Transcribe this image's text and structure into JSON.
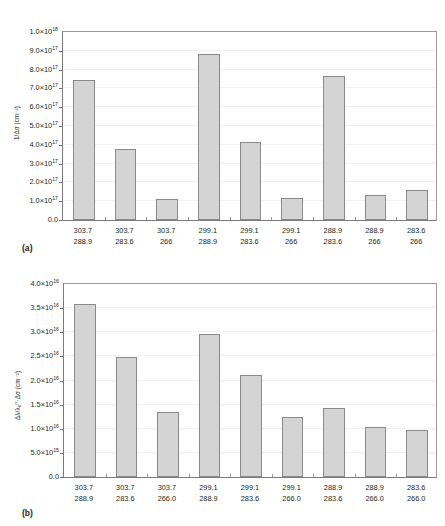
{
  "figure": {
    "panels": [
      {
        "tag": "(a)",
        "ylabel": "1/Δσ (cm⁻²)",
        "ytick_labels": [
          {
            "mantissa": "1.0×10",
            "exp": "18"
          },
          {
            "mantissa": "9.0×10",
            "exp": "17"
          },
          {
            "mantissa": "8.0×10",
            "exp": "17"
          },
          {
            "mantissa": "7.0×10",
            "exp": "17"
          },
          {
            "mantissa": "6.0×10",
            "exp": "17"
          },
          {
            "mantissa": "5.0×10",
            "exp": "17"
          },
          {
            "mantissa": "4.0×10",
            "exp": "17"
          },
          {
            "mantissa": "3.0×10",
            "exp": "17"
          },
          {
            "mantissa": "2.0×10",
            "exp": "17"
          },
          {
            "mantissa": "1.0×10",
            "exp": "17"
          },
          {
            "mantissa": "0.0",
            "exp": ""
          }
        ],
        "xlabels": [
          {
            "line1": "303.7",
            "line2": "288.9"
          },
          {
            "line1": "303.7",
            "line2": "283.6"
          },
          {
            "line1": "303.7",
            "line2": "266"
          },
          {
            "line1": "299.1",
            "line2": "288.9"
          },
          {
            "line1": "299.1",
            "line2": "283.6"
          },
          {
            "line1": "299.1",
            "line2": "266"
          },
          {
            "line1": "288.9",
            "line2": "283.6"
          },
          {
            "line1": "288.9",
            "line2": "266"
          },
          {
            "line1": "283.6",
            "line2": "266"
          }
        ]
      },
      {
        "tag": "(b)",
        "ylabel": "Δλ/λ₀ᶠᶠ·Δσ (cm⁻²)",
        "ytick_labels": [
          {
            "mantissa": "4.0×10",
            "exp": "16"
          },
          {
            "mantissa": "3.5×10",
            "exp": "16"
          },
          {
            "mantissa": "3.0×10",
            "exp": "16"
          },
          {
            "mantissa": "2.5×10",
            "exp": "16"
          },
          {
            "mantissa": "2.0×10",
            "exp": "16"
          },
          {
            "mantissa": "1.5×10",
            "exp": "16"
          },
          {
            "mantissa": "1.0×10",
            "exp": "16"
          },
          {
            "mantissa": "5.0×10",
            "exp": "15"
          },
          {
            "mantissa": "0.0",
            "exp": ""
          }
        ],
        "xlabels": [
          {
            "line1": "303.7",
            "line2": "288.9"
          },
          {
            "line1": "303.7",
            "line2": "283.6"
          },
          {
            "line1": "303.7",
            "line2": "266.0"
          },
          {
            "line1": "299.1",
            "line2": "288.9"
          },
          {
            "line1": "299.1",
            "line2": "283.6"
          },
          {
            "line1": "299.1",
            "line2": "266.0"
          },
          {
            "line1": "288.9",
            "line2": "283.6"
          },
          {
            "line1": "288.9",
            "line2": "266.0"
          },
          {
            "line1": "283.6",
            "line2": "266.0"
          }
        ]
      }
    ],
    "colors": {
      "bar_fill": "#d4d4d4",
      "bar_border": "#8a8a8a",
      "axis": "#7a7a7a",
      "gridline": "#f0f0f0",
      "text": "#231f20"
    }
  },
  "chart_data": [
    {
      "type": "bar",
      "panel": "(a)",
      "title": "",
      "xlabel": "",
      "ylabel": "1/Δσ (cm⁻²)",
      "categories": [
        "303.7 / 288.9",
        "303.7 / 283.6",
        "303.7 / 266",
        "299.1 / 288.9",
        "299.1 / 283.6",
        "299.1 / 266",
        "288.9 / 283.6",
        "288.9 / 266",
        "283.6 / 266"
      ],
      "values": [
        7.45e+17,
        3.8e+17,
        1.12e+17,
        8.85e+17,
        4.15e+17,
        1.17e+17,
        7.65e+17,
        1.35e+17,
        1.62e+17
      ],
      "ylim": [
        0,
        1e+18
      ],
      "ytick_values": [
        0,
        1e+17,
        2e+17,
        3e+17,
        4e+17,
        5e+17,
        6e+17,
        7e+17,
        8e+17,
        9e+17,
        1e+18
      ],
      "grid": true,
      "legend": "none"
    },
    {
      "type": "bar",
      "panel": "(b)",
      "title": "",
      "xlabel": "",
      "ylabel": "Δλ/λ₀ᶠᶠ·Δσ (cm⁻²)",
      "categories": [
        "303.7 / 288.9",
        "303.7 / 283.6",
        "303.7 / 266.0",
        "299.1 / 288.9",
        "299.1 / 283.6",
        "299.1 / 266.0",
        "288.9 / 283.6",
        "288.9 / 266.0",
        "283.6 / 266.0"
      ],
      "values": [
        3.58e+16,
        2.49e+16,
        1.355e+16,
        2.97e+16,
        2.11e+16,
        1.24e+16,
        1.435e+16,
        1.03e+16,
        9800000000000000.0
      ],
      "ylim": [
        0,
        4e+16
      ],
      "ytick_values": [
        0,
        5000000000000000.0,
        1e+16,
        1.5e+16,
        2e+16,
        2.5e+16,
        3e+16,
        3.5e+16,
        4e+16
      ],
      "grid": true,
      "legend": "none"
    }
  ]
}
